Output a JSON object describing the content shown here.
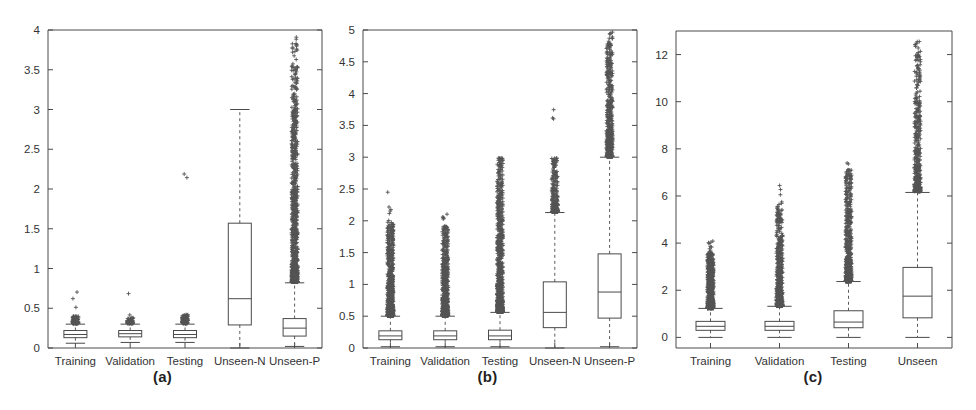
{
  "figure": {
    "background": "#ffffff",
    "axis_color": "#4a4a4a",
    "marker_color": "#555555",
    "panels": [
      {
        "caption": "(a)",
        "caption_x": 185,
        "plot": {
          "left": 48,
          "top": 30,
          "right": 322,
          "bottom": 348
        },
        "yaxis": {
          "min": 0,
          "max": 4,
          "ticks": [
            0,
            0.5,
            1,
            1.5,
            2,
            2.5,
            3,
            3.5,
            4
          ],
          "tick_labels": [
            "0",
            "0.5",
            "1",
            "1.5",
            "2",
            "2.5",
            "3",
            "3.5",
            "4"
          ]
        },
        "categories": [
          "Training",
          "Validation",
          "Testing",
          "Unseen-N",
          "Unseen-P"
        ]
      },
      {
        "caption": "(b)",
        "caption_x": 500,
        "plot": {
          "left": 363,
          "top": 30,
          "right": 637,
          "bottom": 348
        },
        "yaxis": {
          "min": 0,
          "max": 5,
          "ticks": [
            0,
            0.5,
            1,
            1.5,
            2,
            2.5,
            3,
            3.5,
            4,
            4.5,
            5
          ],
          "tick_labels": [
            "0",
            "0.5",
            "1",
            "1.5",
            "2",
            "2.5",
            "3",
            "3.5",
            "4",
            "4.5",
            "5"
          ]
        },
        "categories": [
          "Training",
          "Validation",
          "Testing",
          "Unseen-N",
          "Unseen-P"
        ]
      },
      {
        "caption": "(c)",
        "caption_x": 815,
        "plot": {
          "left": 676,
          "top": 31,
          "right": 952,
          "bottom": 348
        },
        "yaxis": {
          "min": -0.45,
          "max": 13.0,
          "ticks": [
            0,
            2,
            4,
            6,
            8,
            10,
            12
          ],
          "tick_labels": [
            "0",
            "2",
            "4",
            "6",
            "8",
            "10",
            "12"
          ]
        },
        "categories": [
          "Training",
          "Validation",
          "Testing",
          "Unseen"
        ]
      }
    ]
  },
  "chart_data": [
    {
      "type": "box",
      "title": "(a)",
      "xlabel": "",
      "ylabel": "",
      "ylim": [
        0,
        4
      ],
      "yticks": [
        0,
        0.5,
        1,
        1.5,
        2,
        2.5,
        3,
        3.5,
        4
      ],
      "grid": false,
      "categories": [
        "Training",
        "Validation",
        "Testing",
        "Unseen-N",
        "Unseen-P"
      ],
      "boxes": [
        {
          "name": "Training",
          "whisker_low": 0.06,
          "q1": 0.13,
          "median": 0.17,
          "q3": 0.22,
          "whisker_high": 0.3,
          "outlier_min": 0.31,
          "outlier_max": 1.03,
          "outlier_dense_max": 0.4,
          "outlier_count": 120
        },
        {
          "name": "Validation",
          "whisker_low": 0.07,
          "q1": 0.14,
          "median": 0.18,
          "q3": 0.22,
          "whisker_high": 0.3,
          "outlier_min": 0.31,
          "outlier_max": 1.0,
          "outlier_dense_max": 0.38,
          "outlier_count": 70
        },
        {
          "name": "Testing",
          "whisker_low": 0.07,
          "q1": 0.13,
          "median": 0.17,
          "q3": 0.22,
          "whisker_high": 0.3,
          "outlier_min": 0.31,
          "outlier_max": 2.52,
          "outlier_dense_max": 0.42,
          "outlier_count": 90
        },
        {
          "name": "Unseen-N",
          "whisker_low": 0.0,
          "q1": 0.29,
          "median": 0.62,
          "q3": 1.57,
          "whisker_high": 3.0,
          "outlier_min": null,
          "outlier_max": null,
          "outlier_dense_max": null,
          "outlier_count": 0
        },
        {
          "name": "Unseen-P",
          "whisker_low": 0.02,
          "q1": 0.15,
          "median": 0.25,
          "q3": 0.37,
          "whisker_high": 0.82,
          "outlier_min": 0.83,
          "outlier_max": 3.92,
          "outlier_dense_max": 3.55,
          "outlier_count": 900
        }
      ]
    },
    {
      "type": "box",
      "title": "(b)",
      "xlabel": "",
      "ylabel": "",
      "ylim": [
        0,
        5
      ],
      "yticks": [
        0,
        0.5,
        1,
        1.5,
        2,
        2.5,
        3,
        3.5,
        4,
        4.5,
        5
      ],
      "grid": false,
      "categories": [
        "Training",
        "Validation",
        "Testing",
        "Unseen-N",
        "Unseen-P"
      ],
      "boxes": [
        {
          "name": "Training",
          "whisker_low": 0.02,
          "q1": 0.13,
          "median": 0.19,
          "q3": 0.27,
          "whisker_high": 0.5,
          "outlier_min": 0.51,
          "outlier_max": 2.46,
          "outlier_dense_max": 1.95,
          "outlier_count": 700
        },
        {
          "name": "Validation",
          "whisker_low": 0.02,
          "q1": 0.13,
          "median": 0.19,
          "q3": 0.27,
          "whisker_high": 0.5,
          "outlier_min": 0.51,
          "outlier_max": 2.14,
          "outlier_dense_max": 1.94,
          "outlier_count": 600
        },
        {
          "name": "Testing",
          "whisker_low": 0.02,
          "q1": 0.13,
          "median": 0.19,
          "q3": 0.28,
          "whisker_high": 0.56,
          "outlier_min": 0.57,
          "outlier_max": 2.99,
          "outlier_dense_max": 2.95,
          "outlier_count": 750
        },
        {
          "name": "Unseen-N",
          "whisker_low": 0.0,
          "q1": 0.32,
          "median": 0.56,
          "q3": 1.04,
          "whisker_high": 2.13,
          "outlier_min": 2.14,
          "outlier_max": 4.38,
          "outlier_dense_max": 3.0,
          "outlier_count": 240
        },
        {
          "name": "Unseen-P",
          "whisker_low": 0.02,
          "q1": 0.47,
          "median": 0.88,
          "q3": 1.48,
          "whisker_high": 3.0,
          "outlier_min": 3.01,
          "outlier_max": 5.0,
          "outlier_dense_max": 4.8,
          "outlier_count": 500
        }
      ]
    },
    {
      "type": "box",
      "title": "(c)",
      "xlabel": "",
      "ylabel": "",
      "ylim": [
        -0.45,
        13.0
      ],
      "yticks": [
        0,
        2,
        4,
        6,
        8,
        10,
        12
      ],
      "grid": false,
      "categories": [
        "Training",
        "Validation",
        "Testing",
        "Unseen"
      ],
      "boxes": [
        {
          "name": "Training",
          "whisker_low": 0.0,
          "q1": 0.3,
          "median": 0.47,
          "q3": 0.68,
          "whisker_high": 1.23,
          "outlier_min": 1.24,
          "outlier_max": 4.2,
          "outlier_dense_max": 3.55,
          "outlier_count": 620
        },
        {
          "name": "Validation",
          "whisker_low": 0.0,
          "q1": 0.3,
          "median": 0.47,
          "q3": 0.68,
          "whisker_high": 1.32,
          "outlier_min": 1.33,
          "outlier_max": 6.45,
          "outlier_dense_max": 5.55,
          "outlier_count": 520
        },
        {
          "name": "Testing",
          "whisker_low": 0.0,
          "q1": 0.41,
          "median": 0.65,
          "q3": 1.13,
          "whisker_high": 2.37,
          "outlier_min": 2.38,
          "outlier_max": 7.6,
          "outlier_dense_max": 7.2,
          "outlier_count": 560
        },
        {
          "name": "Unseen",
          "whisker_low": 0.0,
          "q1": 0.83,
          "median": 1.75,
          "q3": 2.97,
          "whisker_high": 6.15,
          "outlier_min": 6.2,
          "outlier_max": 12.65,
          "outlier_dense_max": 12.1,
          "outlier_count": 430
        }
      ]
    }
  ]
}
